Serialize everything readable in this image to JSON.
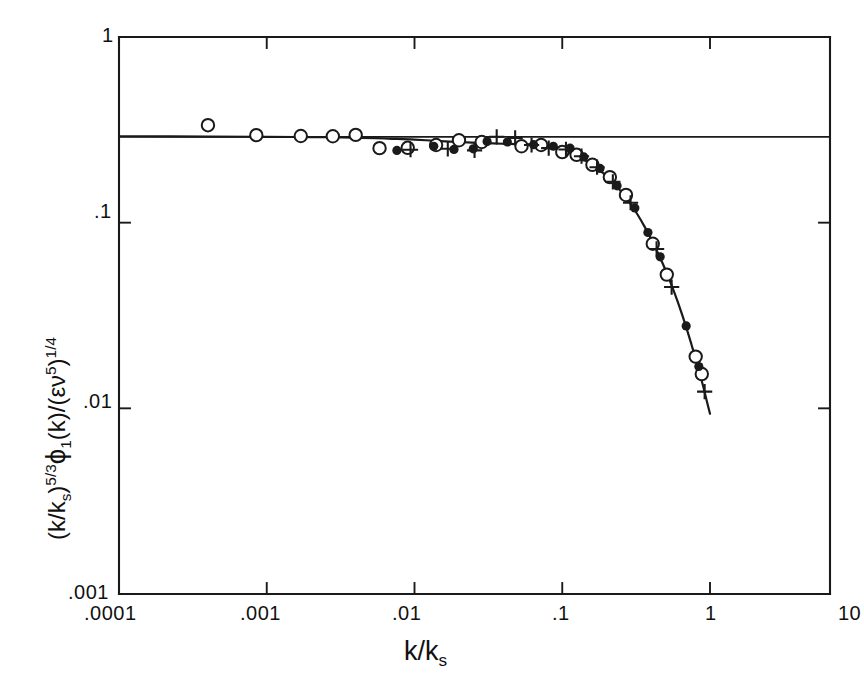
{
  "chart_data": {
    "type": "scatter",
    "title": "",
    "xlabel": "k/k_s",
    "ylabel": "(k/k_s)^(5/3) phi_1(k)/(eps nu^5)^(1/4)",
    "xscale": "log",
    "yscale": "log",
    "xlim": [
      0.0001,
      10
    ],
    "ylim": [
      0.001,
      1
    ],
    "grid": false,
    "legend": "none",
    "xtick_labels": [
      ".0001",
      ".001",
      ".01",
      ".1",
      "1",
      "10"
    ],
    "xtick_values": [
      0.0001,
      0.001,
      0.01,
      0.1,
      1,
      10
    ],
    "ytick_labels": [
      "1",
      ".1",
      ".01",
      ".001"
    ],
    "ytick_values": [
      1,
      0.1,
      0.01,
      0.001
    ],
    "reference_line": {
      "label": "Kolmogorov constant plateau",
      "y": 0.29,
      "x_start": 0.0001,
      "x_end": 10
    },
    "fit_curve": {
      "label": "universal spectrum fit",
      "points": [
        [
          0.0001,
          0.292
        ],
        [
          0.0004,
          0.291
        ],
        [
          0.001,
          0.29
        ],
        [
          0.002,
          0.289
        ],
        [
          0.004,
          0.287
        ],
        [
          0.007,
          0.283
        ],
        [
          0.01,
          0.28
        ],
        [
          0.015,
          0.275
        ],
        [
          0.02,
          0.272
        ],
        [
          0.03,
          0.268
        ],
        [
          0.04,
          0.266
        ],
        [
          0.05,
          0.265
        ],
        [
          0.06,
          0.264
        ],
        [
          0.07,
          0.262
        ],
        [
          0.08,
          0.258
        ],
        [
          0.09,
          0.252
        ],
        [
          0.1,
          0.245
        ],
        [
          0.12,
          0.232
        ],
        [
          0.14,
          0.218
        ],
        [
          0.16,
          0.205
        ],
        [
          0.18,
          0.191
        ],
        [
          0.2,
          0.178
        ],
        [
          0.24,
          0.153
        ],
        [
          0.28,
          0.131
        ],
        [
          0.32,
          0.112
        ],
        [
          0.36,
          0.0955
        ],
        [
          0.4,
          0.0815
        ],
        [
          0.45,
          0.0672
        ],
        [
          0.5,
          0.0556
        ],
        [
          0.55,
          0.046
        ],
        [
          0.6,
          0.0382
        ],
        [
          0.65,
          0.0317
        ],
        [
          0.7,
          0.0264
        ],
        [
          0.75,
          0.022
        ],
        [
          0.8,
          0.0185
        ],
        [
          0.85,
          0.0155
        ],
        [
          0.9,
          0.0131
        ],
        [
          0.95,
          0.011
        ],
        [
          1.0,
          0.00935
        ]
      ]
    },
    "series": [
      {
        "name": "open-circle",
        "marker": "open circle",
        "points": [
          [
            0.0004,
            0.335
          ],
          [
            0.00085,
            0.296
          ],
          [
            0.0017,
            0.293
          ],
          [
            0.0028,
            0.292
          ],
          [
            0.004,
            0.297
          ],
          [
            0.0058,
            0.252
          ],
          [
            0.009,
            0.253
          ],
          [
            0.014,
            0.262
          ],
          [
            0.02,
            0.278
          ],
          [
            0.0285,
            0.272
          ],
          [
            0.053,
            0.258
          ],
          [
            0.072,
            0.262
          ],
          [
            0.1,
            0.24
          ],
          [
            0.125,
            0.232
          ],
          [
            0.16,
            0.205
          ],
          [
            0.21,
            0.176
          ],
          [
            0.27,
            0.141
          ],
          [
            0.41,
            0.077
          ],
          [
            0.51,
            0.0525
          ],
          [
            0.8,
            0.019
          ],
          [
            0.88,
            0.0153
          ]
        ]
      },
      {
        "name": "filled-circle",
        "marker": "filled circle",
        "points": [
          [
            0.0076,
            0.245
          ],
          [
            0.0135,
            0.258
          ],
          [
            0.0185,
            0.248
          ],
          [
            0.025,
            0.25
          ],
          [
            0.031,
            0.274
          ],
          [
            0.0425,
            0.272
          ],
          [
            0.064,
            0.263
          ],
          [
            0.087,
            0.258
          ],
          [
            0.113,
            0.252
          ],
          [
            0.14,
            0.226
          ],
          [
            0.18,
            0.196
          ],
          [
            0.235,
            0.158
          ],
          [
            0.31,
            0.12
          ],
          [
            0.38,
            0.0885
          ],
          [
            0.46,
            0.0655
          ],
          [
            0.69,
            0.0278
          ],
          [
            0.84,
            0.0168
          ]
        ]
      },
      {
        "name": "plus",
        "marker": "plus",
        "points": [
          [
            0.0094,
            0.247
          ],
          [
            0.0168,
            0.25
          ],
          [
            0.0255,
            0.245
          ],
          [
            0.036,
            0.29
          ],
          [
            0.048,
            0.286
          ],
          [
            0.062,
            0.262
          ],
          [
            0.081,
            0.252
          ],
          [
            0.106,
            0.248
          ],
          [
            0.135,
            0.228
          ],
          [
            0.172,
            0.199
          ],
          [
            0.22,
            0.166
          ],
          [
            0.29,
            0.128
          ],
          [
            0.435,
            0.0722
          ],
          [
            0.55,
            0.045
          ],
          [
            0.92,
            0.0123
          ]
        ]
      }
    ]
  },
  "axis_labels": {
    "x_title_html": "k/k<sub>s</sub>",
    "y_title_parts": {
      "p1": "(k/k",
      "sub1": "s",
      "p2": ")",
      "sup1": "5/3",
      "phi": "ϕ",
      "sub2": "1",
      "p3": "(k)/(εν",
      "sup2": "5",
      "p4": ")",
      "sup3": "1/4"
    }
  },
  "ticks": {
    "x": [
      {
        "label": ".0001",
        "px": 119
      },
      {
        "label": ".001",
        "px": 267
      },
      {
        "label": ".01",
        "px": 413
      },
      {
        "label": ".1",
        "px": 562
      },
      {
        "label": "1",
        "px": 710
      },
      {
        "label": "10",
        "px": 838
      }
    ],
    "y": [
      {
        "label": "1",
        "px": 37
      },
      {
        "label": ".1",
        "px": 213
      },
      {
        "label": ".01",
        "px": 403
      },
      {
        "label": ".001",
        "px": 594
      }
    ]
  },
  "style": {
    "ink": "#1a1a1a",
    "background": "#ffffff"
  }
}
